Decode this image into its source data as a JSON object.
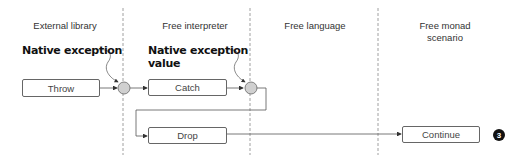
{
  "lanes": [
    {
      "title": "External library"
    },
    {
      "title": "Free interpreter"
    },
    {
      "title": "Free language"
    },
    {
      "title": "Free monad scenario",
      "title_line1": "Free monad",
      "title_line2": "scenario"
    }
  ],
  "callouts": {
    "native_exception": "Native exception",
    "native_exception_value_line1": "Native exception",
    "native_exception_value_line2": "value"
  },
  "boxes": {
    "throw": "Throw",
    "catch": "Catch",
    "drop": "Drop",
    "continue": "Continue"
  },
  "badge": "3",
  "colors": {
    "line": "#555555",
    "node_fill": "#d0d0d0",
    "badge": "#111111"
  }
}
